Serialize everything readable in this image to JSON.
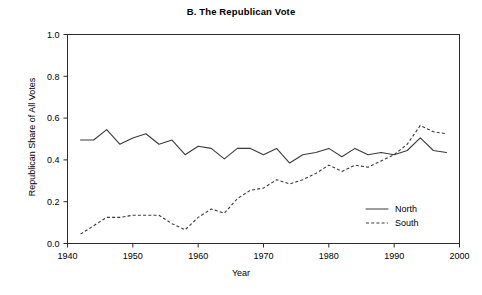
{
  "chart_data": {
    "type": "line",
    "title": "B. The Republican Vote",
    "xlabel": "Year",
    "ylabel": "Republican Share of All Votes",
    "xlim": [
      1940,
      2000
    ],
    "ylim": [
      0.0,
      1.0
    ],
    "grid": false,
    "legend_position": "bottom-right",
    "xticks": [
      1940,
      1950,
      1960,
      1970,
      1980,
      1990,
      2000
    ],
    "xtick_labels": [
      "1940",
      "1950",
      "1960",
      "1970",
      "1980",
      "1990",
      "2000"
    ],
    "yticks": [
      0.0,
      0.2,
      0.4,
      0.6,
      0.8,
      1.0
    ],
    "ytick_labels": [
      "0.0",
      "0.2",
      "0.4",
      "0.6",
      "0.8",
      "1.0"
    ],
    "x": [
      1942,
      1944,
      1946,
      1948,
      1950,
      1952,
      1954,
      1956,
      1958,
      1960,
      1962,
      1964,
      1966,
      1968,
      1970,
      1972,
      1974,
      1976,
      1978,
      1980,
      1982,
      1984,
      1986,
      1988,
      1990,
      1992,
      1994,
      1996,
      1998
    ],
    "series": [
      {
        "name": "North",
        "style": "solid",
        "values": [
          0.495,
          0.495,
          0.545,
          0.475,
          0.505,
          0.525,
          0.475,
          0.495,
          0.425,
          0.465,
          0.455,
          0.405,
          0.455,
          0.455,
          0.425,
          0.455,
          0.385,
          0.425,
          0.435,
          0.455,
          0.415,
          0.455,
          0.425,
          0.435,
          0.425,
          0.445,
          0.505,
          0.445,
          0.435
        ]
      },
      {
        "name": "South",
        "style": "dashed",
        "values": [
          0.045,
          0.085,
          0.125,
          0.125,
          0.135,
          0.135,
          0.135,
          0.095,
          0.065,
          0.125,
          0.165,
          0.145,
          0.215,
          0.255,
          0.265,
          0.305,
          0.285,
          0.305,
          0.335,
          0.375,
          0.345,
          0.375,
          0.365,
          0.395,
          0.425,
          0.475,
          0.565,
          0.535,
          0.525
        ]
      }
    ]
  },
  "legend": {
    "entries": [
      {
        "label": "North"
      },
      {
        "label": "South"
      }
    ]
  }
}
